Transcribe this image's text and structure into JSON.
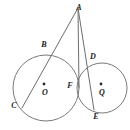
{
  "figure": {
    "background_color": "#ffffff",
    "stroke_color": "#7a7a7a",
    "label_color": "#202020",
    "width": 130,
    "height": 130
  },
  "circles": [
    {
      "name": "circle-o",
      "center_label": "O",
      "cx": 46,
      "cy": 88,
      "r": 33
    },
    {
      "name": "circle-q",
      "center_label": "Q",
      "cx": 102,
      "cy": 88,
      "r": 25
    }
  ],
  "points": [
    {
      "id": "A",
      "label": "A",
      "x": 78,
      "y": 8,
      "label_x": 79,
      "label_y": 8
    },
    {
      "id": "B",
      "label": "B",
      "x": 51,
      "y": 50,
      "label_x": 44,
      "label_y": 45
    },
    {
      "id": "C",
      "label": "C",
      "x": 22,
      "y": 108,
      "label_x": 14,
      "label_y": 106
    },
    {
      "id": "D",
      "label": "D",
      "x": 89,
      "y": 62,
      "label_x": 93,
      "label_y": 57
    },
    {
      "id": "E",
      "label": "E",
      "x": 94,
      "y": 110,
      "label_x": 96,
      "label_y": 117
    },
    {
      "id": "F",
      "label": "F",
      "x": 79,
      "y": 88,
      "label_x": 70,
      "label_y": 86
    },
    {
      "id": "O",
      "label": "O",
      "x": 46,
      "y": 88,
      "label_x": 45,
      "label_y": 93
    },
    {
      "id": "Q",
      "label": "Q",
      "x": 102,
      "y": 88,
      "label_x": 102,
      "label_y": 93
    }
  ],
  "segments": [
    {
      "name": "secant-a-b-c",
      "from": "A",
      "to": "C",
      "path": "M 78 8 L 22 108"
    },
    {
      "name": "tangent-a-f",
      "from": "A",
      "to": "F",
      "path": "M 78 8 L 79 88"
    },
    {
      "name": "secant-a-d-e",
      "from": "A",
      "to": "E",
      "path": "M 78 8 L 94 110"
    }
  ],
  "center_dots": [
    {
      "name": "center-dot-o",
      "x": 44,
      "y": 84,
      "r": 1.4
    },
    {
      "name": "center-dot-q",
      "x": 101,
      "y": 84,
      "r": 1.4
    }
  ]
}
